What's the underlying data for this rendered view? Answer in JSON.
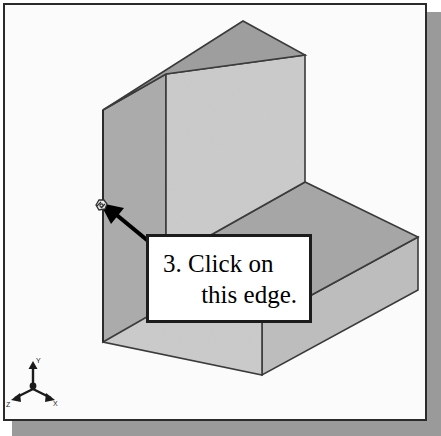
{
  "figure": {
    "kind": "cad-isometric-view",
    "background_color": "#fbfbfb",
    "frame_border_color": "#2a2a2a",
    "shadow_color": "#9a9a9a"
  },
  "callout": {
    "line1": "3. Click on",
    "line2": "this edge.",
    "border_color": "#1c1c1c",
    "fill_color": "#ffffff"
  },
  "pointer": {
    "arrow_color": "#000000",
    "cursor_icon": "select-edge-cursor-icon"
  },
  "model": {
    "name": "l-shaped-block",
    "faces": [
      {
        "name": "tall-wall-top-face",
        "shade": "#9e9e9e"
      },
      {
        "name": "tall-wall-front-face",
        "shade": "#c9c9c9"
      },
      {
        "name": "tall-wall-left-face",
        "shade": "#ababab"
      },
      {
        "name": "base-slab-top-face",
        "shade": "#a8a8a8"
      },
      {
        "name": "base-slab-front-face",
        "shade": "#c9c9c9"
      },
      {
        "name": "base-slab-right-face",
        "shade": "#bdbdbd"
      }
    ],
    "edge_color": "#3a3a3a",
    "highlighted_edge": "tall-wall-left-vertical-edge"
  },
  "axis_triad": {
    "name": "orientation-triad",
    "x_label": "X",
    "y_label": "Y",
    "z_label": "Z",
    "color": "#1b1b1b"
  }
}
